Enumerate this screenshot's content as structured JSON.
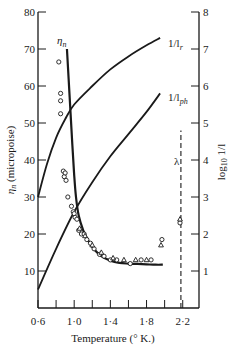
{
  "chart_data": {
    "type": "line",
    "title": "",
    "xlabel": "Temperature (° K.)",
    "ylabel": "η_n (micropoise)",
    "ylabel_right": "log₁₀ 1/l",
    "xlim": [
      0.6,
      2.38
    ],
    "ylim": [
      0,
      80
    ],
    "ylim_right": [
      0,
      8
    ],
    "grid": false,
    "legend": "inline curve labels",
    "x_ticks": [
      0.6,
      0.8,
      1.0,
      1.2,
      1.4,
      1.6,
      1.8,
      2.0,
      2.2
    ],
    "x_tick_labels": [
      "0·6",
      "1·0",
      "1·4",
      "1·8",
      "2·2"
    ],
    "y_ticks_left": [
      10,
      20,
      30,
      40,
      50,
      60,
      70,
      80
    ],
    "y_ticks_right": [
      1,
      2,
      3,
      4,
      5,
      6,
      7,
      8
    ],
    "series": [
      {
        "name": "η_n",
        "axis": "left",
        "style": "solid-thick",
        "x": [
          0.92,
          0.95,
          0.98,
          1.0,
          1.02,
          1.05,
          1.1,
          1.15,
          1.2,
          1.3,
          1.4,
          1.5,
          1.6,
          1.7,
          1.8,
          1.9,
          1.98
        ],
        "y": [
          70,
          57,
          44,
          36,
          30,
          25,
          21,
          18.5,
          16.5,
          14,
          12.8,
          12.2,
          12.0,
          11.9,
          11.8,
          11.7,
          11.7
        ]
      },
      {
        "name": "1/l_r",
        "axis": "right",
        "style": "solid",
        "x": [
          0.6,
          0.7,
          0.8,
          0.9,
          1.0,
          1.2,
          1.4,
          1.6,
          1.8,
          1.95
        ],
        "y": [
          3.0,
          3.9,
          4.6,
          5.1,
          5.5,
          6.0,
          6.45,
          6.8,
          7.1,
          7.3
        ]
      },
      {
        "name": "1/l_ph",
        "axis": "right",
        "style": "solid",
        "x": [
          0.6,
          0.8,
          1.0,
          1.2,
          1.4,
          1.6,
          1.8,
          1.95
        ],
        "y": [
          0.5,
          1.6,
          2.6,
          3.4,
          4.1,
          4.7,
          5.3,
          5.8
        ]
      },
      {
        "name": "λ",
        "axis": "left",
        "style": "dashed-vertical",
        "x": [
          2.18,
          2.18
        ],
        "y": [
          0,
          48
        ]
      },
      {
        "name": "measured (circles)",
        "axis": "left",
        "marker": "circle",
        "x": [
          0.83,
          0.85,
          0.85,
          0.85,
          0.88,
          0.89,
          0.9,
          0.91,
          0.93,
          0.97,
          0.99,
          1.0,
          1.01,
          1.03,
          1.05,
          1.08,
          1.11,
          1.14,
          1.18,
          1.22,
          1.28,
          1.33,
          1.4,
          1.47,
          1.62,
          1.74,
          1.85,
          1.97,
          2.17
        ],
        "y": [
          66.5,
          58,
          56,
          52.5,
          37,
          35.5,
          36.5,
          34.5,
          30,
          27.5,
          26,
          25.5,
          24.5,
          24,
          21,
          20,
          20,
          18.5,
          17.5,
          16,
          14.5,
          14,
          13,
          13,
          12,
          13,
          13,
          18.5,
          23
        ]
      },
      {
        "name": "measured (triangles)",
        "axis": "left",
        "marker": "triangle",
        "x": [
          1.06,
          1.12,
          1.2,
          1.3,
          1.43,
          1.55,
          1.68,
          1.8,
          1.96,
          2.17
        ],
        "y": [
          21.5,
          19.5,
          17,
          15,
          13.5,
          13,
          13,
          13,
          17,
          24
        ]
      }
    ],
    "annotations": [
      {
        "text": "η_n",
        "near": "top of η_n curve"
      },
      {
        "text": "1/l_r",
        "near": "upper end of 1/l_r curve"
      },
      {
        "text": "1/l_ph",
        "near": "upper end of 1/l_ph curve"
      },
      {
        "text": "λ",
        "near": "top of dashed lambda line"
      }
    ]
  },
  "labels": {
    "xlabel": "Temperature (° K.)",
    "ylabel_left_sym": "η",
    "ylabel_left_sub": "n",
    "ylabel_left_rest": " (micropoise)",
    "ylabel_right_main": "log",
    "ylabel_right_sub": "10",
    "ylabel_right_rest": " 1/l",
    "eta_sym": "η",
    "eta_sub": "n",
    "lr_main": "1/l",
    "lr_sub": "r",
    "lph_main": "1/l",
    "lph_sub": "ph",
    "lambda": "λ"
  },
  "x_tick_labels": [
    "0·6",
    "1·0",
    "1·4",
    "1·8",
    "2·2"
  ],
  "y_left_tick_labels": [
    "10",
    "20",
    "30",
    "40",
    "50",
    "60",
    "70",
    "80"
  ],
  "y_right_tick_labels": [
    "1",
    "2",
    "3",
    "4",
    "5",
    "6",
    "7",
    "8"
  ]
}
